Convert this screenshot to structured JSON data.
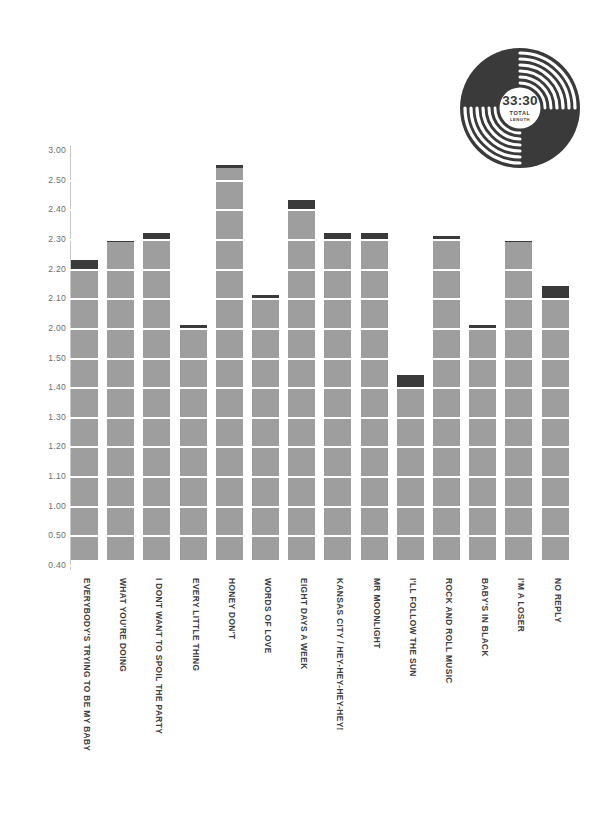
{
  "record": {
    "time": "33:30",
    "label_line1": "TOTAL",
    "label_line2": "LENGTH",
    "icon": "vinyl-record-icon",
    "color": "#3a3a3a"
  },
  "colors": {
    "bar": "#9e9e9e",
    "bar_cap": "#3a3a3a",
    "axis": "#c9c9c9",
    "tick_text": "#6e6e6e",
    "label_text": "#3f3f3f",
    "background": "#ffffff",
    "gridline": "#ffffff"
  },
  "chart_data": {
    "type": "bar",
    "title": "",
    "subtitle": "",
    "xlabel": "",
    "ylabel": "",
    "grid": true,
    "legend": "none",
    "total_length": "33:30",
    "tick_labels": [
      "3.00",
      "2.50",
      "2.40",
      "2.30",
      "2.20",
      "2.10",
      "2.00",
      "1.50",
      "1.40",
      "1.30",
      "1.20",
      "1.10",
      "1.00",
      "0.50",
      "0.40"
    ],
    "ylim": [
      0.4,
      3.0
    ],
    "categories": [
      "EVERYBODY'S TRYING TO BE MY BABY",
      "WHAT YOU'RE DOING",
      "I DONT WANT TO SPOIL THE PARTY",
      "EVERY LITTLE THING",
      "HONEY DON'T",
      "WORDS OF LOVE",
      "EIGHT DAYS A WEEK",
      "KANSAS CITY / HEY-HEY-HEY-HEY!",
      "MR MOONLIGHT",
      "I'LL FOLLOW THE SUN",
      "ROCK AND ROLL MUSIC",
      "BABY'S IN BLACK",
      "I'M A LOSER",
      "NO REPLY"
    ],
    "values": [
      2.23,
      2.3,
      2.32,
      2.01,
      2.75,
      2.11,
      2.43,
      2.32,
      2.32,
      1.44,
      2.31,
      2.01,
      2.3,
      2.14
    ],
    "cap_start_values": [
      2.2,
      2.3,
      2.3,
      2.0,
      2.7,
      2.1,
      2.4,
      2.3,
      2.3,
      1.4,
      2.3,
      2.0,
      2.3,
      2.1
    ],
    "series": [
      {
        "name": "Track length (minutes)",
        "values": [
          2.23,
          2.3,
          2.32,
          2.01,
          2.75,
          2.11,
          2.43,
          2.32,
          2.32,
          1.44,
          2.31,
          2.01,
          2.3,
          2.14
        ]
      }
    ]
  }
}
